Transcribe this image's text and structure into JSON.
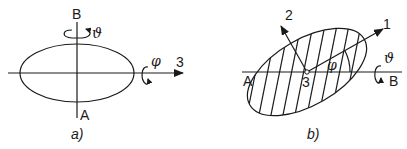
{
  "panel_a": {
    "caption": "a)",
    "labels": {
      "top_axis": "B",
      "bottom_axis": "A",
      "right_axis": "3",
      "rotation_vertical": "ϑ",
      "rotation_horizontal": "φ"
    }
  },
  "panel_b": {
    "caption": "b)",
    "labels": {
      "left": "A",
      "right": "B",
      "center": "3",
      "axis_1": "1",
      "axis_2": "2",
      "angle": "φ",
      "rotation": "ϑ"
    }
  },
  "colors": {
    "stroke": "#1a1a1a",
    "background": "#ffffff"
  }
}
